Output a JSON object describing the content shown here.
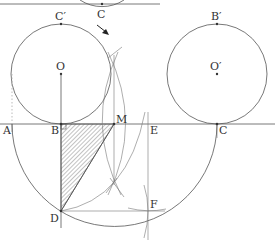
{
  "figure": {
    "type": "geometric-construction",
    "colors": {
      "stroke": "#555555",
      "text": "#333333",
      "hatch": "#666666",
      "background": "#ffffff"
    },
    "points": [
      {
        "id": "C_top",
        "label": "C",
        "x": 102,
        "y": 4,
        "label_x": 97,
        "label_y": 18
      },
      {
        "id": "C_prime",
        "label": "C′",
        "x": 61,
        "y": 24,
        "label_x": 55,
        "label_y": 20
      },
      {
        "id": "B_prime",
        "label": "B′",
        "x": 217,
        "y": 24,
        "label_x": 211,
        "label_y": 20
      },
      {
        "id": "O",
        "label": "O",
        "x": 61,
        "y": 74,
        "label_x": 56,
        "label_y": 70
      },
      {
        "id": "O_prime",
        "label": "O′",
        "x": 217,
        "y": 74,
        "label_x": 210,
        "label_y": 70
      },
      {
        "id": "A",
        "label": "A",
        "x": 12,
        "y": 124,
        "label_x": 3,
        "label_y": 134
      },
      {
        "id": "B",
        "label": "B",
        "x": 61,
        "y": 124,
        "label_x": 51,
        "label_y": 134
      },
      {
        "id": "M",
        "label": "M",
        "x": 114,
        "y": 124,
        "label_x": 116,
        "label_y": 123
      },
      {
        "id": "E",
        "label": "E",
        "x": 148,
        "y": 124,
        "label_x": 150,
        "label_y": 134
      },
      {
        "id": "C",
        "label": "C",
        "x": 217,
        "y": 124,
        "label_x": 219,
        "label_y": 134
      },
      {
        "id": "D",
        "label": "D",
        "x": 61,
        "y": 211,
        "label_x": 50,
        "label_y": 222
      },
      {
        "id": "F",
        "label": "F",
        "x": 148,
        "y": 211,
        "label_x": 150,
        "label_y": 208
      }
    ],
    "circles": [
      {
        "name": "circle-O",
        "center": "O",
        "radius": 50
      },
      {
        "name": "circle-O-prime",
        "center": "O′",
        "radius": 50
      }
    ],
    "shaded_region": "triangle B-D-M (hatched)",
    "arrow": {
      "from": [
        97,
        25
      ],
      "to": [
        108,
        34
      ],
      "meaning": "rolling direction"
    }
  }
}
